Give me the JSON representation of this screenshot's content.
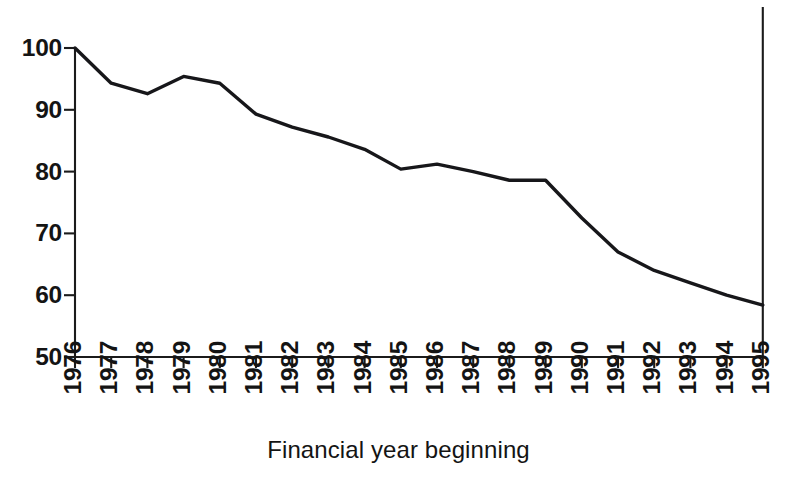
{
  "chart_data": {
    "type": "line",
    "title": "",
    "xlabel": "Financial year beginning",
    "ylabel": "",
    "categories": [
      "1976",
      "1977",
      "1978",
      "1979",
      "1980",
      "1981",
      "1982",
      "1983",
      "1984",
      "1985",
      "1986",
      "1987",
      "1988",
      "1989",
      "1990",
      "1991",
      "1992",
      "1993",
      "1994",
      "1995"
    ],
    "values": [
      100.0,
      94.3,
      92.6,
      95.4,
      94.3,
      89.3,
      87.2,
      85.6,
      83.6,
      80.4,
      81.2,
      80.0,
      78.6,
      78.6,
      72.5,
      67.0,
      64.0,
      62.0,
      60.0,
      58.4
    ],
    "series": [
      {
        "name": "index",
        "values": [
          100.0,
          94.3,
          92.6,
          95.4,
          94.3,
          89.3,
          87.2,
          85.6,
          83.6,
          80.4,
          81.2,
          80.0,
          78.6,
          78.6,
          72.5,
          67.0,
          64.0,
          62.0,
          60.0,
          58.4
        ]
      }
    ],
    "ylim": [
      50,
      100
    ],
    "yticks": [
      50,
      60,
      70,
      80,
      90,
      100
    ],
    "ytick_labels": [
      "50",
      "60",
      "70",
      "80",
      "90",
      "100"
    ],
    "xtick_labels": [
      "1976",
      "1977",
      "1978",
      "1979",
      "1980",
      "1981",
      "1982",
      "1983",
      "1984",
      "1985",
      "1986",
      "1987",
      "1988",
      "1989",
      "1990",
      "1991",
      "1992",
      "1993",
      "1994",
      "1995"
    ],
    "grid": false,
    "legend": null,
    "legend_position": "none",
    "line_color": "#17171a",
    "axis_color": "#1b1b1b",
    "background_color": "#ffffff",
    "xtick_rotation": 90,
    "annotations": []
  }
}
